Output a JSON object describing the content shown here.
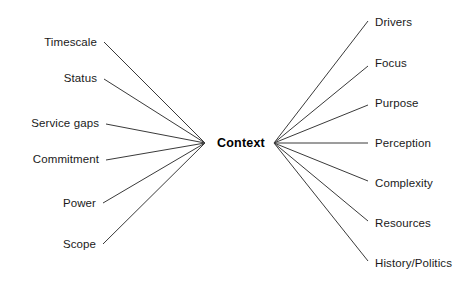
{
  "diagram": {
    "type": "mind-map",
    "title": "Context",
    "background_color": "#ffffff",
    "line_color": "#3a3a3a",
    "text_color": "#1a1a1a",
    "hub": {
      "label": "Context",
      "x": 241,
      "y": 143,
      "left_anchor_x": 205,
      "right_anchor_x": 274
    },
    "left_branches": [
      {
        "label": "Timescale",
        "label_x": 97,
        "label_y": 43,
        "line_x": 104,
        "line_y": 42
      },
      {
        "label": "Status",
        "label_x": 97,
        "label_y": 79,
        "line_x": 104,
        "line_y": 79
      },
      {
        "label": "Service gaps",
        "label_x": 99,
        "label_y": 124,
        "line_x": 106,
        "line_y": 124
      },
      {
        "label": "Commitment",
        "label_x": 99,
        "label_y": 160,
        "line_x": 106,
        "line_y": 160
      },
      {
        "label": "Power",
        "label_x": 96,
        "label_y": 204,
        "line_x": 103,
        "line_y": 203
      },
      {
        "label": "Scope",
        "label_x": 96,
        "label_y": 245,
        "line_x": 103,
        "line_y": 244
      }
    ],
    "right_branches": [
      {
        "label": "Drivers",
        "label_x": 375,
        "label_y": 23,
        "line_x": 368,
        "line_y": 21
      },
      {
        "label": "Focus",
        "label_x": 375,
        "label_y": 64,
        "line_x": 368,
        "line_y": 66
      },
      {
        "label": "Purpose",
        "label_x": 375,
        "label_y": 104,
        "line_x": 368,
        "line_y": 105
      },
      {
        "label": "Perception",
        "label_x": 375,
        "label_y": 144,
        "line_x": 368,
        "line_y": 143
      },
      {
        "label": "Complexity",
        "label_x": 375,
        "label_y": 184,
        "line_x": 368,
        "line_y": 181
      },
      {
        "label": "Resources",
        "label_x": 375,
        "label_y": 224,
        "line_x": 368,
        "line_y": 221
      },
      {
        "label": "History/Politics",
        "label_x": 375,
        "label_y": 264,
        "line_x": 368,
        "line_y": 261
      }
    ]
  }
}
